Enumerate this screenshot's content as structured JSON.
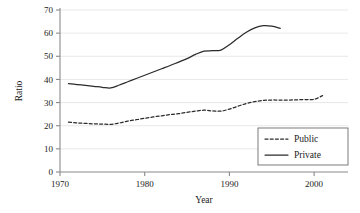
{
  "chart_data": {
    "type": "line",
    "title": "",
    "xlabel": "Year",
    "ylabel": "Ratio",
    "xlim": [
      1970,
      2004
    ],
    "ylim": [
      0,
      70
    ],
    "xticks": [
      1970,
      1980,
      1990,
      2000
    ],
    "yticks": [
      0,
      10,
      20,
      30,
      40,
      50,
      60,
      70
    ],
    "xtick_labels": [
      "1970",
      "1980",
      "1990",
      "2000"
    ],
    "ytick_labels": [
      "0",
      "10",
      "20",
      "30",
      "40",
      "50",
      "60",
      "70"
    ],
    "grid": "horizontal",
    "legend_position": "lower-right",
    "series": [
      {
        "name": "Public",
        "style": "dashed",
        "color": "#2b2b2b",
        "x": [
          1971,
          1972,
          1973,
          1974,
          1975,
          1976,
          1977,
          1978,
          1979,
          1980,
          1981,
          1982,
          1983,
          1984,
          1985,
          1986,
          1987,
          1988,
          1989,
          1990,
          1991,
          1992,
          1993,
          1994,
          1995,
          1996,
          1997,
          1998,
          1999,
          2000,
          2001
        ],
        "values": [
          21.5,
          21.2,
          21.0,
          20.8,
          20.7,
          20.6,
          21.2,
          22.0,
          22.6,
          23.2,
          23.8,
          24.3,
          24.8,
          25.2,
          25.8,
          26.3,
          26.7,
          26.4,
          26.3,
          27.2,
          28.4,
          29.6,
          30.4,
          30.9,
          31.1,
          31.1,
          31.1,
          31.2,
          31.3,
          31.4,
          33.0
        ]
      },
      {
        "name": "Private",
        "style": "solid",
        "color": "#2b2b2b",
        "x": [
          1971,
          1972,
          1973,
          1974,
          1975,
          1976,
          1977,
          1978,
          1979,
          1980,
          1981,
          1982,
          1983,
          1984,
          1985,
          1986,
          1987,
          1988,
          1989,
          1990,
          1991,
          1992,
          1993,
          1994,
          1995,
          1996
        ],
        "values": [
          38.2,
          37.8,
          37.4,
          37.0,
          36.6,
          36.3,
          37.6,
          39.0,
          40.4,
          41.8,
          43.2,
          44.6,
          46.0,
          47.5,
          49.0,
          50.8,
          52.2,
          52.4,
          52.7,
          55.0,
          57.8,
          60.4,
          62.3,
          63.2,
          63.0,
          62.1
        ]
      }
    ],
    "legend": [
      {
        "label": "Public",
        "style": "dashed"
      },
      {
        "label": "Private",
        "style": "solid"
      }
    ]
  },
  "plot": {
    "left_px": 60,
    "right_px": 348,
    "top_px": 10,
    "bottom_px": 172,
    "axis_color": "#8a8a8a",
    "grid_color": "#e2e2e2",
    "line_color": "#2b2b2b"
  }
}
